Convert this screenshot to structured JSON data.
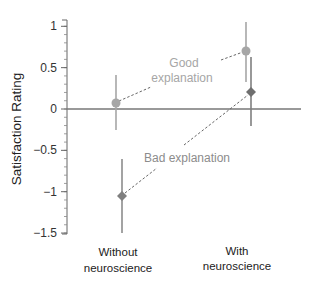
{
  "chart_data": {
    "type": "scatter",
    "title": "",
    "xlabel": "",
    "ylabel": "Satisfaction Rating",
    "ylim": [
      -1.5,
      1
    ],
    "yticks": [
      1,
      0.5,
      0,
      -0.5,
      -1,
      -1.5
    ],
    "ytick_labels": [
      "1",
      "0.5",
      "0",
      "−0.5",
      "−1",
      "−1.5"
    ],
    "minor_tick_step": 0.1,
    "grid": false,
    "categories": [
      {
        "line1": "Without",
        "line2": "neuroscience"
      },
      {
        "line1": "With",
        "line2": "neuroscience"
      }
    ],
    "series": [
      {
        "name": "Good explanation",
        "label_line1": "Good",
        "label_line2": "explanation",
        "marker": "circle",
        "color": "#a6a6a6",
        "label_color": "#a6a6a6",
        "values": [
          0.07,
          0.7
        ],
        "error_upper": [
          0.41,
          1.05
        ],
        "error_lower": [
          -0.25,
          0.33
        ]
      },
      {
        "name": "Bad explanation",
        "label_line1": "Bad explanation",
        "marker": "diamond",
        "color": "#7f7f7f",
        "label_color": "#8c8c8c",
        "values": [
          -1.05,
          0.21
        ],
        "error_upper": [
          -0.6,
          0.63
        ],
        "error_lower": [
          -1.5,
          -0.2
        ]
      }
    ],
    "legend_position": "inline-annotations"
  }
}
